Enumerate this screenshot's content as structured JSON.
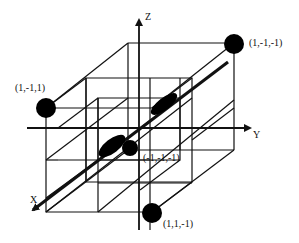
{
  "diagram": {
    "type": "3d-cube-lattice",
    "projection": "oblique",
    "colors": {
      "line": "#111111",
      "point": "#000000",
      "background": "#ffffff"
    },
    "axes": [
      {
        "id": "z",
        "label": "Z"
      },
      {
        "id": "y",
        "label": "Y"
      },
      {
        "id": "x",
        "label": "X"
      }
    ],
    "points": [
      {
        "id": "p1",
        "label": "(1,-1,1)"
      },
      {
        "id": "p2",
        "label": "(1,-1,-1)"
      },
      {
        "id": "p3",
        "label": "(-1,-1,-1)"
      },
      {
        "id": "p4",
        "label": "(1,1,-1)"
      }
    ],
    "central_shape": "dumbbell-lobes-along-x-axis"
  }
}
